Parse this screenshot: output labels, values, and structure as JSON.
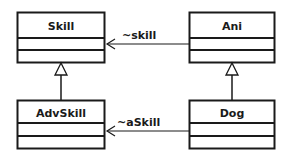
{
  "diagram": {
    "type": "uml-class-diagram",
    "classes": [
      {
        "id": "skill",
        "name": "Skill"
      },
      {
        "id": "ani",
        "name": "Ani"
      },
      {
        "id": "advskill",
        "name": "AdvSkill"
      },
      {
        "id": "dog",
        "name": "Dog"
      }
    ],
    "associations": [
      {
        "from": "Ani",
        "to": "Skill",
        "label": "~skill",
        "kind": "navigable-association"
      },
      {
        "from": "Dog",
        "to": "AdvSkill",
        "label": "~aSkill",
        "kind": "navigable-association"
      }
    ],
    "generalizations": [
      {
        "child": "AdvSkill",
        "parent": "Skill"
      },
      {
        "child": "Dog",
        "parent": "Ani"
      }
    ],
    "colors": {
      "line": "#1a1a1a",
      "background": "#ffffff"
    }
  }
}
